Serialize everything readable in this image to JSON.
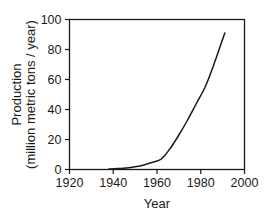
{
  "chart_data": {
    "type": "line",
    "title": "",
    "subtitle": "",
    "xlabel": "Year",
    "ylabel_line1": "Production",
    "ylabel_line2": "(million metric tons / year)",
    "xlim": [
      1920,
      2000
    ],
    "ylim": [
      0,
      100
    ],
    "xticks": [
      1920,
      1940,
      1960,
      1980,
      2000
    ],
    "xtick_labels": [
      "1920",
      "1940",
      "1960",
      "1980",
      "2000"
    ],
    "yticks": [
      0,
      20,
      40,
      60,
      80,
      100
    ],
    "ytick_labels": [
      "0",
      "20",
      "40",
      "60",
      "80",
      "100"
    ],
    "grid": false,
    "legend": false,
    "legend_position": "none",
    "line_color": "#1a1a1a",
    "background_color": "#ffffff",
    "series": [
      {
        "name": "Production",
        "x": [
          1938,
          1942,
          1946,
          1950,
          1954,
          1958,
          1962,
          1966,
          1970,
          1974,
          1978,
          1982,
          1986,
          1991
        ],
        "values": [
          0.3,
          0.6,
          1.0,
          1.8,
          3.0,
          4.8,
          7.0,
          14.0,
          23.0,
          33.0,
          44.0,
          55.0,
          70.0,
          91.0
        ]
      }
    ],
    "annotations": []
  },
  "axis": {
    "x_tick_count": 5,
    "y_tick_count": 6
  }
}
